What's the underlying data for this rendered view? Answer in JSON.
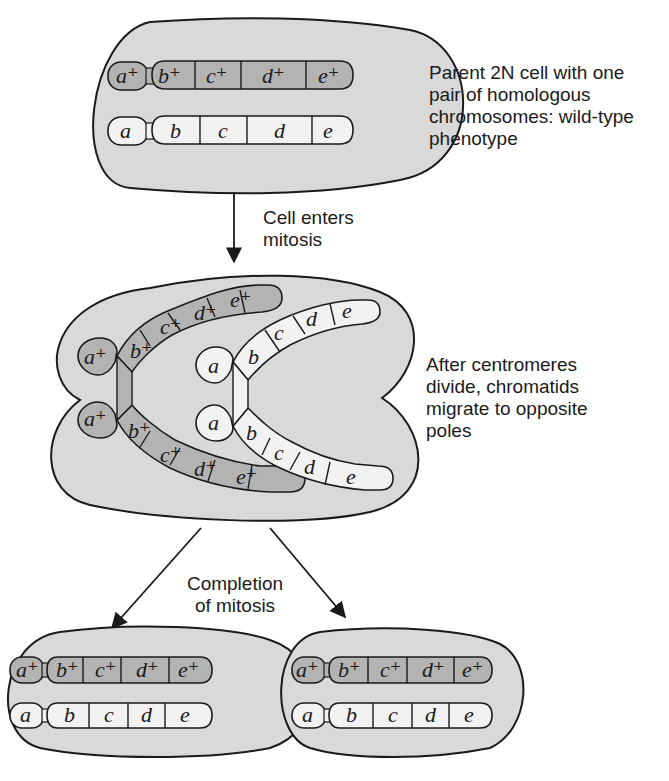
{
  "colors": {
    "cell_fill": "#d9d9d9",
    "mutant_chromosome": "#f2f2f2",
    "wildtype_chromosome": "#b3b3b3",
    "outline": "#1a1a1a",
    "background": "#ffffff"
  },
  "parent_cell": {
    "caption": [
      "Parent 2N cell with one",
      "pair of homologous",
      "chromosomes: wild-type",
      "phenotype"
    ],
    "wildtype_chromosome": [
      "a⁺",
      "b⁺",
      "c⁺",
      "d⁺",
      "e⁺"
    ],
    "mutant_chromosome": [
      "a",
      "b",
      "c",
      "d",
      "e"
    ]
  },
  "step1": {
    "caption": [
      "Cell enters",
      "mitosis"
    ]
  },
  "dividing_cell": {
    "caption": [
      "After centromeres",
      "divide, chromatids",
      "migrate to opposite",
      "poles"
    ],
    "wildtype_chromatid_top": [
      "a⁺",
      "b⁺",
      "c⁺",
      "d⁺",
      "e⁺"
    ],
    "wildtype_chromatid_bottom": [
      "a⁺",
      "b⁺",
      "c⁺",
      "d⁺",
      "e⁺"
    ],
    "mutant_chromatid_top": [
      "a",
      "b",
      "c",
      "d",
      "e"
    ],
    "mutant_chromatid_bottom": [
      "a",
      "b",
      "c",
      "d",
      "e"
    ]
  },
  "step2": {
    "caption": [
      "Completion",
      "of mitosis"
    ]
  },
  "daughter_cells": [
    {
      "wildtype_chromosome": [
        "a⁺",
        "b⁺",
        "c⁺",
        "d⁺",
        "e⁺"
      ],
      "mutant_chromosome": [
        "a",
        "b",
        "c",
        "d",
        "e"
      ]
    },
    {
      "wildtype_chromosome": [
        "a⁺",
        "b⁺",
        "c⁺",
        "d⁺",
        "e⁺"
      ],
      "mutant_chromosome": [
        "a",
        "b",
        "c",
        "d",
        "e"
      ]
    }
  ]
}
